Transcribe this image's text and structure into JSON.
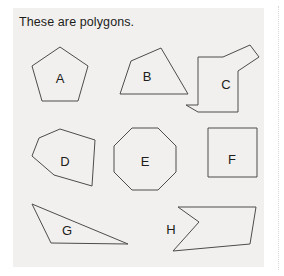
{
  "page": {
    "width": 284,
    "height": 276,
    "background_color": "#ffffff"
  },
  "panel": {
    "background_color": "#f1f0ee",
    "title": "These are polygons."
  },
  "separator": {
    "style": "dotted",
    "color": "#d8d8d8"
  },
  "style": {
    "stroke_color": "#4c4c4c",
    "fill_color": "#f1f0ee",
    "text_color": "#1d1d1b"
  },
  "shapes": [
    {
      "label": "A",
      "kind": "pentagon",
      "sides": 5,
      "convex": true,
      "label_x": 47,
      "label_y": 72,
      "points": "47,39 75,58 65,93 29,93 19,58"
    },
    {
      "label": "B",
      "kind": "quadrilateral",
      "sides": 4,
      "convex": true,
      "label_x": 134,
      "label_y": 70,
      "points": "148,40 118,53 107,86 175,86"
    },
    {
      "label": "C",
      "kind": "irregular-concave-polygon",
      "sides": 11,
      "convex": false,
      "label_x": 213,
      "label_y": 78,
      "points": "237,37 210,49 185,49 185,97 173,97 185,104 185,104 193,104 193,104 225,104 225,63 246,49"
    },
    {
      "label": "D",
      "kind": "irregular-pentagon",
      "sides": 6,
      "convex": true,
      "label_x": 52,
      "label_y": 155,
      "points": "47,121 82,132 79,178 41,167 19,148 26,130"
    },
    {
      "label": "E",
      "kind": "octagon",
      "sides": 8,
      "convex": true,
      "label_x": 132,
      "label_y": 155,
      "points": "119,120 145,120 163,138 163,164 145,182 119,182 101,164 101,138"
    },
    {
      "label": "F",
      "kind": "square",
      "sides": 4,
      "convex": true,
      "label_x": 219,
      "label_y": 153,
      "points": "195,120 244,120 244,169 195,169"
    },
    {
      "label": "G",
      "kind": "triangle",
      "sides": 3,
      "convex": true,
      "label_x": 54,
      "label_y": 224,
      "points": "19,196 115,236 38,235"
    },
    {
      "label": "H",
      "kind": "arrow-concave-polygon",
      "sides": 6,
      "convex": false,
      "label_x": 158,
      "label_y": 223,
      "points": "165,199 243,199 237,236 160,243 186,214 165,199"
    }
  ]
}
